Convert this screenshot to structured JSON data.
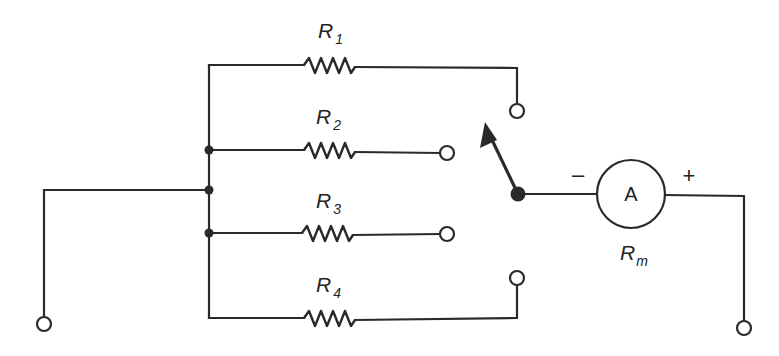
{
  "diagram": {
    "type": "circuit-schematic",
    "resistors": [
      {
        "label": "R",
        "subscript": "1"
      },
      {
        "label": "R",
        "subscript": "2"
      },
      {
        "label": "R",
        "subscript": "3"
      },
      {
        "label": "R",
        "subscript": "4"
      }
    ],
    "meter": {
      "symbol": "A",
      "resistance_label": "R",
      "resistance_subscript": "m",
      "negative_sign": "–",
      "positive_sign": "+"
    },
    "switch": {
      "type": "rotary-selector",
      "positions": 4,
      "pointer": "arrow pointing toward R1 position"
    },
    "terminals": {
      "left": "input terminal",
      "right": "output terminal"
    },
    "colors": {
      "line": "#2a2a2a",
      "background": "#ffffff"
    }
  }
}
